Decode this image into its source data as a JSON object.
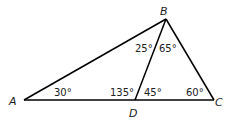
{
  "diagram": {
    "vertices": {
      "A": {
        "label": "A",
        "x": 24,
        "y": 100
      },
      "B": {
        "label": "B",
        "x": 166,
        "y": 19
      },
      "C": {
        "label": "C",
        "x": 214,
        "y": 100
      },
      "D": {
        "label": "D",
        "x": 135,
        "y": 100
      }
    },
    "segments": [
      [
        "A",
        "B"
      ],
      [
        "B",
        "C"
      ],
      [
        "A",
        "C"
      ],
      [
        "B",
        "D"
      ]
    ],
    "angles": {
      "A": "30°",
      "ABD": "25°",
      "DBC": "65°",
      "ADB": "135°",
      "BDC": "45°",
      "C": "60°"
    }
  }
}
